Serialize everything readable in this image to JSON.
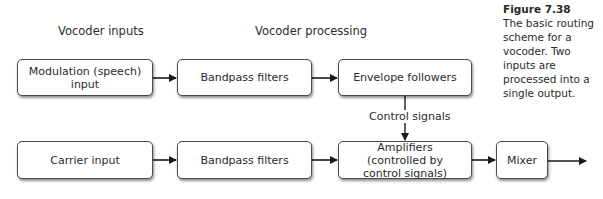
{
  "section_labels": {
    "inputs": "Vocoder inputs",
    "processing": "Vocoder processing"
  },
  "row1": {
    "modulation_input": "Modulation (speech) input",
    "bandpass_filters": "Bandpass filters",
    "envelope_followers": "Envelope followers"
  },
  "control_signals_label": "Control signals",
  "row2": {
    "carrier_input": "Carrier input",
    "bandpass_filters": "Bandpass filters",
    "amplifiers": "Amplifiers (controlled by control signals)",
    "mixer": "Mixer"
  },
  "caption": {
    "figure_number": "Figure 7.38",
    "text": "The basic routing scheme for a vocoder. Two inputs are processed into a single output."
  },
  "colors": {
    "stroke": "#1a1a1a",
    "box_border": "#4a4a4a",
    "text": "#2a2a2a",
    "background": "#ffffff"
  }
}
